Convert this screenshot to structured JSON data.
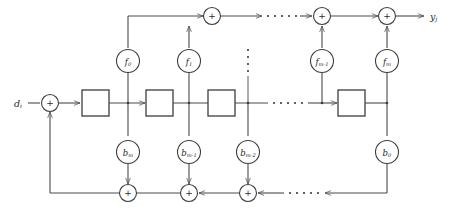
{
  "diagram": {
    "input_label": "d",
    "input_subscript": "i",
    "output_label": "y",
    "output_subscript": "j",
    "sum_symbol": "+",
    "colors": {
      "wire": "#4a4a4a",
      "node_stroke": "#3d3d3d",
      "background": "#ffffff",
      "text": "#1f1f1f"
    },
    "feedforward_coefficients": [
      {
        "base": "f",
        "sub": "0"
      },
      {
        "base": "f",
        "sub": "1"
      },
      {
        "base": "f",
        "sub": "m-1"
      },
      {
        "base": "f",
        "sub": "m"
      }
    ],
    "feedback_coefficients": [
      {
        "base": "b",
        "sub": "m"
      },
      {
        "base": "b",
        "sub": "m-1"
      },
      {
        "base": "b",
        "sub": "m-2"
      },
      {
        "base": "b",
        "sub": "0"
      }
    ],
    "top_adders": [
      {
        "symbol": "+"
      },
      {
        "symbol": "+"
      },
      {
        "symbol": "+"
      }
    ],
    "bottom_adders": [
      {
        "symbol": "+"
      },
      {
        "symbol": "+"
      },
      {
        "symbol": "+"
      }
    ],
    "input_adder": {
      "symbol": "+"
    },
    "delay_blocks": [
      {
        "label": ""
      },
      {
        "label": ""
      },
      {
        "label": ""
      },
      {
        "label": ""
      }
    ],
    "ellipses": {
      "top_row": "• • • • •",
      "middle_row": "• • • • •",
      "bottom_row": "• • • • •",
      "vertical": "⋮"
    }
  }
}
